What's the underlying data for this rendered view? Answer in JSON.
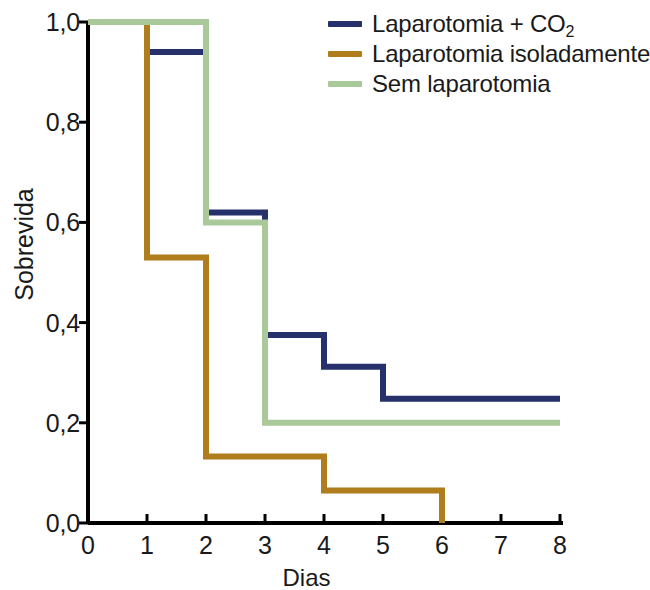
{
  "chart_data": {
    "type": "line",
    "subtype": "kaplan-meier-step",
    "title": "",
    "xlabel": "Dias",
    "ylabel": "Sobrevida",
    "xlim": [
      0,
      8
    ],
    "ylim": [
      0.0,
      1.0
    ],
    "grid": false,
    "legend_position": "top-right",
    "x_ticks": [
      "0",
      "1",
      "2",
      "3",
      "4",
      "5",
      "6",
      "7",
      "8"
    ],
    "x_tick_values": [
      0,
      1,
      2,
      3,
      4,
      5,
      6,
      7,
      8
    ],
    "y_ticks": [
      "0,0",
      "0,2",
      "0,4",
      "0,6",
      "0,8",
      "1,0"
    ],
    "y_tick_values": [
      0.0,
      0.2,
      0.4,
      0.6,
      0.8,
      1.0
    ],
    "decimal_separator": ",",
    "series": [
      {
        "name": "Laparotomia + CO2",
        "label_html": "Laparotomia + CO<sub>2</sub>",
        "color": "#26306b",
        "x": [
          0,
          1,
          2,
          3,
          4,
          5,
          8
        ],
        "values": [
          1.0,
          0.94,
          0.62,
          0.375,
          0.312,
          0.248,
          0.248
        ],
        "steps": [
          {
            "from": 0,
            "to": 1,
            "y": 1.0
          },
          {
            "from": 1,
            "to": 2,
            "y": 0.94
          },
          {
            "from": 2,
            "to": 3,
            "y": 0.62
          },
          {
            "from": 3,
            "to": 4,
            "y": 0.375
          },
          {
            "from": 4,
            "to": 5,
            "y": 0.312
          },
          {
            "from": 5,
            "to": 8,
            "y": 0.248
          }
        ]
      },
      {
        "name": "Laparotomia isoladamente",
        "label_html": "Laparotomia isoladamente",
        "color": "#b07d1c",
        "x": [
          0,
          1,
          2,
          4,
          6
        ],
        "values": [
          1.0,
          0.53,
          0.133,
          0.065,
          0.0
        ],
        "steps": [
          {
            "from": 0,
            "to": 1,
            "y": 1.0
          },
          {
            "from": 1,
            "to": 2,
            "y": 0.53
          },
          {
            "from": 2,
            "to": 4,
            "y": 0.133
          },
          {
            "from": 4,
            "to": 6,
            "y": 0.065
          },
          {
            "from": 6,
            "to": 6,
            "y": 0.0
          }
        ]
      },
      {
        "name": "Sem laparotomia",
        "label_html": "Sem laparotomia",
        "color": "#a9c99b",
        "x": [
          0,
          2,
          3,
          8
        ],
        "values": [
          1.0,
          0.6,
          0.2,
          0.2
        ],
        "steps": [
          {
            "from": 0,
            "to": 2,
            "y": 1.0
          },
          {
            "from": 2,
            "to": 3,
            "y": 0.6
          },
          {
            "from": 3,
            "to": 8,
            "y": 0.2
          }
        ]
      }
    ]
  },
  "axes": {
    "x_title": "Dias",
    "y_title": "Sobrevida",
    "x_tick_labels": [
      "0",
      "1",
      "2",
      "3",
      "4",
      "5",
      "6",
      "7",
      "8"
    ],
    "y_tick_labels": [
      "1,0",
      "0,8",
      "0,6",
      "0,4",
      "0,2",
      "0,0"
    ],
    "axis_color": "#000000"
  },
  "legend": {
    "items": [
      {
        "label": "Laparotomia + CO",
        "sub": "2",
        "color": "#26306b"
      },
      {
        "label": "Laparotomia isoladamente",
        "sub": "",
        "color": "#b07d1c"
      },
      {
        "label": "Sem laparotomia",
        "sub": "",
        "color": "#a9c99b"
      }
    ]
  }
}
